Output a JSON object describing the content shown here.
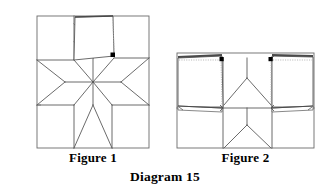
{
  "diagram": {
    "title": "Diagram 15",
    "figure1_label": "Figure 1",
    "figure2_label": "Figure 2",
    "colors": {
      "background": "#ffffff",
      "line": "#5a5a5a",
      "line_dark": "#3b3b3b",
      "fold_edge": "#9a9a9a",
      "dotted_edge": "#b5b5b5",
      "marker_dot": "#000000",
      "caption_text": "#000000"
    },
    "figure1": {
      "name": "Figure 1",
      "description": "Star block with one corner square folded up along its diagonal, dot marking the pivot corner",
      "bounds": {
        "x": 37,
        "y": 16,
        "width": 112,
        "height": 132
      },
      "star": {
        "center": {
          "x": 93,
          "y": 82
        },
        "points": 8,
        "type": "LeMoyne star"
      },
      "markers": [
        {
          "name": "pivot-dot",
          "x": 113,
          "y": 55
        }
      ],
      "flap": {
        "name": "folded-corner-flap",
        "dotted_edge": "right",
        "corners": [
          {
            "x": 75,
            "y": 17
          },
          {
            "x": 113,
            "y": 16
          },
          {
            "x": 114,
            "y": 56
          },
          {
            "x": 74,
            "y": 60
          }
        ]
      }
    },
    "figure2": {
      "name": "Figure 2",
      "description": "Star block with two top corner squares folded down and two lower squares folded, four dots marking pivot corners",
      "bounds": {
        "x": 177,
        "y": 53,
        "width": 137,
        "height": 95
      },
      "markers": [
        {
          "name": "pivot-dot-top-left",
          "x": 222,
          "y": 59
        },
        {
          "name": "pivot-dot-top-right",
          "x": 271,
          "y": 59
        },
        {
          "name": "pivot-dot-mid-left",
          "x": 223,
          "y": 108
        },
        {
          "name": "pivot-dot-mid-right",
          "x": 272,
          "y": 108
        }
      ],
      "flaps": [
        {
          "name": "flap-top-left",
          "dotted_edge": "right"
        },
        {
          "name": "flap-top-right",
          "dotted_edge": "right"
        },
        {
          "name": "flap-mid-left",
          "dotted_edge": "none"
        },
        {
          "name": "flap-mid-right",
          "dotted_edge": "none"
        }
      ]
    }
  }
}
